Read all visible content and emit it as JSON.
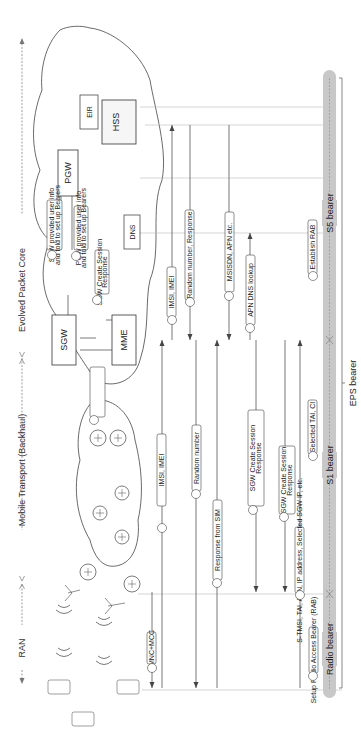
{
  "sections": {
    "ran": "RAN",
    "mobile_transport": "Mobile Transport (Backhaul)",
    "epc": "Evolved Packet Core"
  },
  "nodes": {
    "sgw": "SGW",
    "pgw": "PGW",
    "mme": "MME",
    "hss": "HSS",
    "eir": "EIR",
    "dns": "DNS"
  },
  "steps": [
    {
      "num": "1",
      "text": "MNC+MCC"
    },
    {
      "num": "2",
      "text": "IMSI, IMEI"
    },
    {
      "num": "3",
      "text": "IMSI, IMEI"
    },
    {
      "num": "4",
      "text": "Random number, Response"
    },
    {
      "num": "5",
      "text": "Random number"
    },
    {
      "num": "6",
      "text": "Response from SIM"
    },
    {
      "num": "7",
      "text": "MSISDN, APN etc."
    },
    {
      "num": "8",
      "text": "APN DNS lookup"
    },
    {
      "num": "9a",
      "text": "SGW provided user info and told to set up Bearers",
      "line1": "SGW provided user info",
      "line2": "and told to set up Bearers"
    },
    {
      "num": "9b",
      "text": "PGW provided user info and told to set up Bearers",
      "line1": "PGW provided user info",
      "line2": "and told to set up Bearers"
    },
    {
      "num": "10a",
      "text": "SGW Create Session Response",
      "line1": "SGW Create Session",
      "line2": "Response"
    },
    {
      "num": "10b",
      "text": "SGW Create Session Response",
      "line1": "SGW Create Session",
      "line2": "Response"
    },
    {
      "num": "11",
      "text": "S-TMSI, TAI, APN, IP address, Selected SGW IP, etc.",
      "line1": "S-TMSI, TAI, APN, IP address,",
      "line2": "Selected SGW IP, etc."
    },
    {
      "num": "12",
      "text": "Setup Radio Access Bearer (RAB)",
      "line1": "Setup Radio Access",
      "line2": "Bearer (RAB)"
    },
    {
      "num": "13",
      "text": "Selected TAI, CI"
    },
    {
      "num": "14",
      "text": "Establish RAB"
    },
    {
      "num": "14",
      "text": "Establish S1 Tunnel"
    },
    {
      "num": "14",
      "text": "Establish S5 Tunnel"
    }
  ],
  "bearers": {
    "radio": "Radio bearer",
    "s1": "S1 bearer",
    "s5": "S5 bearer",
    "eps": "EPS bearer"
  },
  "colors": {
    "line": "#555555",
    "lane": "#bbbbbb",
    "bearer_band": "#c8c8c8",
    "box_stroke": "#333333"
  }
}
